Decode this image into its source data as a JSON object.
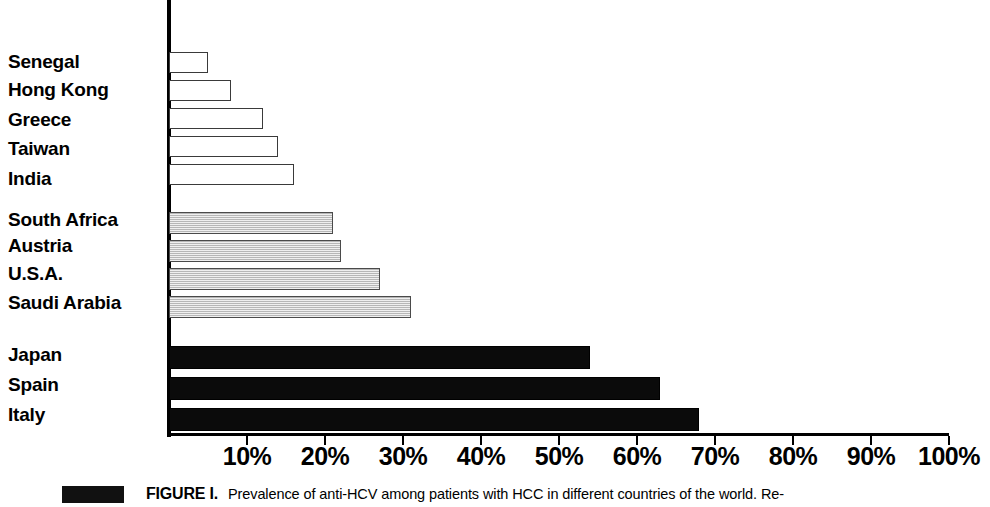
{
  "chart_data": {
    "type": "bar",
    "orientation": "horizontal",
    "title": "",
    "xlabel": "",
    "ylabel": "",
    "xlim": [
      0,
      100
    ],
    "xtick_labels": [
      "10%",
      "20%",
      "30%",
      "40%",
      "50%",
      "60%",
      "70%",
      "80%",
      "90%",
      "100%"
    ],
    "xtick_values": [
      10,
      20,
      30,
      40,
      50,
      60,
      70,
      80,
      90,
      100
    ],
    "grid": false,
    "legend": "none",
    "categories": [
      "Senegal",
      "Hong Kong",
      "Greece",
      "Taiwan",
      "India",
      "South Africa",
      "Austria",
      "U.S.A.",
      "Saudi Arabia",
      "Japan",
      "Spain",
      "Italy"
    ],
    "values": [
      5,
      8,
      12,
      14,
      16,
      21,
      22,
      27,
      31,
      54,
      63,
      68
    ],
    "groups": [
      {
        "name": "low-prevalence",
        "fill": "white",
        "color": "#ffffff",
        "categories": [
          "Senegal",
          "Hong Kong",
          "Greece",
          "Taiwan",
          "India"
        ],
        "values": [
          5,
          8,
          12,
          14,
          16
        ]
      },
      {
        "name": "intermediate-prevalence",
        "fill": "gray",
        "color": "#d2d2d2",
        "categories": [
          "South Africa",
          "Austria",
          "U.S.A.",
          "Saudi Arabia"
        ],
        "values": [
          21,
          22,
          27,
          31
        ]
      },
      {
        "name": "high-prevalence",
        "fill": "black",
        "color": "#0b0b0b",
        "categories": [
          "Japan",
          "Spain",
          "Italy"
        ],
        "values": [
          54,
          63,
          68
        ]
      }
    ],
    "bars": [
      {
        "label": "Senegal",
        "value": 5,
        "style": "white",
        "top": 52,
        "height": 21
      },
      {
        "label": "Hong Kong",
        "value": 8,
        "style": "white",
        "top": 80,
        "height": 21
      },
      {
        "label": "Greece",
        "value": 12,
        "style": "white",
        "top": 108,
        "height": 21
      },
      {
        "label": "Taiwan",
        "value": 14,
        "style": "white",
        "top": 136,
        "height": 21
      },
      {
        "label": "India",
        "value": 16,
        "style": "white",
        "top": 164,
        "height": 21
      },
      {
        "label": "South Africa",
        "value": 21,
        "style": "gray",
        "top": 212,
        "height": 22
      },
      {
        "label": "Austria",
        "value": 22,
        "style": "gray",
        "top": 240,
        "height": 22
      },
      {
        "label": "U.S.A.",
        "value": 27,
        "style": "gray",
        "top": 268,
        "height": 22
      },
      {
        "label": "Saudi Arabia",
        "value": 31,
        "style": "gray",
        "top": 296,
        "height": 22
      },
      {
        "label": "Japan",
        "value": 54,
        "style": "black",
        "top": 346,
        "height": 23
      },
      {
        "label": "Spain",
        "value": 63,
        "style": "black",
        "top": 377,
        "height": 23
      },
      {
        "label": "Italy",
        "value": 68,
        "style": "black",
        "top": 408,
        "height": 23
      }
    ],
    "category_labels": [
      {
        "text": "Senegal",
        "top": 52
      },
      {
        "text": "Hong Kong",
        "top": 80
      },
      {
        "text": "Greece",
        "top": 110
      },
      {
        "text": "Taiwan",
        "top": 139
      },
      {
        "text": "India",
        "top": 169
      },
      {
        "text": "South Africa",
        "top": 210
      },
      {
        "text": "Austria",
        "top": 236
      },
      {
        "text": "U.S.A.",
        "top": 264
      },
      {
        "text": "Saudi Arabia",
        "top": 293
      },
      {
        "text": "Japan",
        "top": 345
      },
      {
        "text": "Spain",
        "top": 375
      },
      {
        "text": "Italy",
        "top": 405
      }
    ]
  },
  "caption": {
    "figure_label": "FIGURE I.",
    "text": "Prevalence of anti-HCV among patients with HCC in different countries of the world. Re-"
  }
}
